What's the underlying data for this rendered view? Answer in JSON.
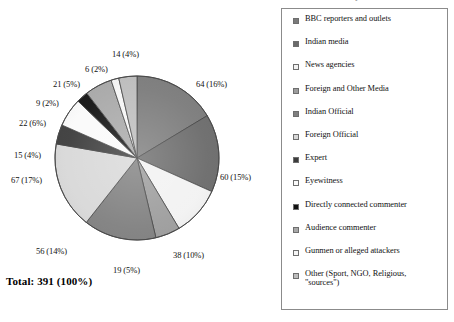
{
  "title_fragment": "ء",
  "total": {
    "label": "Total: 391 (100%)"
  },
  "legend": {
    "items": [
      {
        "label": "BBC reporters and outlets",
        "color": "#7a7a7a"
      },
      {
        "label": "Indian media",
        "color": "#6a6a6a"
      },
      {
        "label": "News agencies",
        "color": "#f2f2f2"
      },
      {
        "label": "Foreign and Other Media",
        "color": "#9c9c9c"
      },
      {
        "label": "Indian Official",
        "color": "#7f7f7f"
      },
      {
        "label": "Foreign Official",
        "color": "#d8d8d8"
      },
      {
        "label": "Expert",
        "color": "#3b3b3b"
      },
      {
        "label": "Eyewitness",
        "color": "#fafafa"
      },
      {
        "label": "Directly connected commenter",
        "color": "#111111"
      },
      {
        "label": "Audience commenter",
        "color": "#a8a8a8"
      },
      {
        "label": "Gunmen or alleged attackers",
        "color": "#f5f5f5"
      },
      {
        "label": "Other (Sport, NGO, Religious,\n\"sources\")",
        "color": "#bdbdbd"
      }
    ]
  },
  "chart_data": {
    "type": "pie",
    "title": "",
    "total": 391,
    "total_label": "Total: 391 (100%)",
    "start_angle_deg": 0,
    "direction": "clockwise",
    "center": [
      137,
      158
    ],
    "radius": 82,
    "legend_position": "right",
    "categories": [
      "BBC reporters and outlets",
      "Indian media",
      "News agencies",
      "Foreign and Other Media",
      "Indian Official",
      "Foreign Official",
      "Expert",
      "Eyewitness",
      "Directly connected commenter",
      "Audience commenter",
      "Gunmen or alleged attackers",
      "Other (Sport, NGO, Religious, \"sources\")"
    ],
    "values": [
      64,
      60,
      38,
      19,
      56,
      67,
      15,
      22,
      9,
      21,
      6,
      14
    ],
    "percents": [
      16,
      15,
      10,
      5,
      14,
      17,
      4,
      6,
      2,
      5,
      2,
      4
    ],
    "colors": [
      "#7a7a7a",
      "#6a6a6a",
      "#f2f2f2",
      "#9c9c9c",
      "#7f7f7f",
      "#d8d8d8",
      "#3b3b3b",
      "#fafafa",
      "#111111",
      "#a8a8a8",
      "#f5f5f5",
      "#bdbdbd"
    ],
    "data_labels": [
      "64 (16%)",
      "60 (15%)",
      "38 (10%)",
      "19 (5%)",
      "56 (14%)",
      "67 (17%)",
      "15 (4%)",
      "22 (6%)",
      "9 (2%)",
      "21 (5%)",
      "6 (2%)",
      "14 (4%)"
    ],
    "label_positions": [
      {
        "x": 196,
        "y": 79,
        "align": "left"
      },
      {
        "x": 220,
        "y": 172,
        "align": "left"
      },
      {
        "x": 173,
        "y": 250,
        "align": "left"
      },
      {
        "x": 113,
        "y": 265,
        "align": "left"
      },
      {
        "x": 36,
        "y": 246,
        "align": "left"
      },
      {
        "x": 11,
        "y": 175,
        "align": "left"
      },
      {
        "x": 14,
        "y": 150,
        "align": "left"
      },
      {
        "x": 19,
        "y": 118,
        "align": "left"
      },
      {
        "x": 36,
        "y": 98,
        "align": "left"
      },
      {
        "x": 53,
        "y": 79,
        "align": "left"
      },
      {
        "x": 85,
        "y": 64,
        "align": "left"
      },
      {
        "x": 112,
        "y": 49,
        "align": "left"
      }
    ]
  }
}
